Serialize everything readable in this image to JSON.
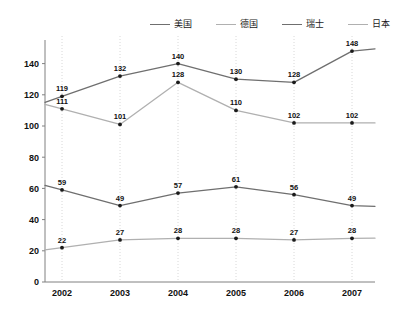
{
  "chart_data": {
    "type": "line",
    "title": "",
    "xlabel": "",
    "ylabel": "",
    "categories": [
      "2002",
      "2003",
      "2004",
      "2005",
      "2006",
      "2007"
    ],
    "ylim": [
      0,
      150
    ],
    "yticks": [
      0,
      20,
      40,
      60,
      80,
      100,
      120,
      140
    ],
    "grid": "vertical-dotted",
    "legend_position": "top-right",
    "series": [
      {
        "name": "美国",
        "color": "#6f6f6f",
        "values": [
          119,
          132,
          140,
          130,
          128,
          148
        ]
      },
      {
        "name": "德国",
        "color": "#b0b0b0",
        "values": [
          111,
          101,
          128,
          110,
          102,
          102
        ]
      },
      {
        "name": "瑞士",
        "color": "#6f6f6f",
        "values": [
          59,
          49,
          57,
          61,
          56,
          49
        ]
      },
      {
        "name": "日本",
        "color": "#b0b0b0",
        "values": [
          22,
          27,
          28,
          28,
          27,
          28
        ]
      }
    ]
  },
  "legend": {
    "items": [
      {
        "label": "美国",
        "color": "#6f6f6f"
      },
      {
        "label": "德国",
        "color": "#b0b0b0"
      },
      {
        "label": "瑞士",
        "color": "#6f6f6f"
      },
      {
        "label": "日本",
        "color": "#b0b0b0"
      }
    ]
  },
  "axes": {
    "y_tick_labels": [
      "0",
      "20",
      "40",
      "60",
      "80",
      "100",
      "120",
      "140"
    ],
    "x_tick_labels": [
      "2002",
      "2003",
      "2004",
      "2005",
      "2006",
      "2007"
    ],
    "axis_color": "#808080",
    "gridline_color": "#d8d8d8"
  }
}
